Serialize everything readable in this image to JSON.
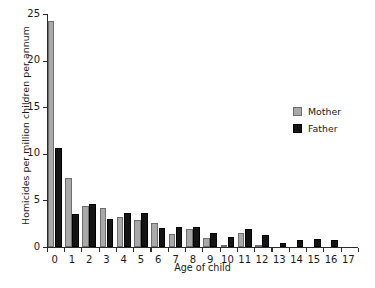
{
  "chart_data": {
    "type": "bar",
    "title": "",
    "xlabel": "Age of child",
    "ylabel": "Homicides per million children per annum",
    "categories": [
      "0",
      "1",
      "2",
      "3",
      "4",
      "5",
      "6",
      "7",
      "8",
      "9",
      "10",
      "11",
      "12",
      "13",
      "14",
      "15",
      "16",
      "17"
    ],
    "ylim": [
      0,
      25
    ],
    "yticks": [
      0,
      5,
      10,
      15,
      20,
      25
    ],
    "grid": false,
    "legend_position": "right-middle",
    "series": [
      {
        "name": "Mother",
        "color": "#a9a9a9",
        "values": [
          24.3,
          7.4,
          4.4,
          4.2,
          3.2,
          2.9,
          2.6,
          1.4,
          1.9,
          1.0,
          0.2,
          1.5,
          0.1,
          0.0,
          0.0,
          0.0,
          0.0,
          0.0
        ]
      },
      {
        "name": "Father",
        "color": "#141414",
        "values": [
          10.6,
          3.5,
          4.6,
          3.0,
          3.6,
          3.6,
          2.0,
          2.2,
          2.2,
          1.5,
          1.1,
          1.9,
          1.3,
          0.4,
          0.8,
          0.9,
          0.7,
          0.0
        ]
      }
    ]
  },
  "legend": {
    "items": [
      {
        "label": "Mother",
        "color": "#a9a9a9"
      },
      {
        "label": "Father",
        "color": "#141414"
      }
    ]
  },
  "caption_sliver": " "
}
